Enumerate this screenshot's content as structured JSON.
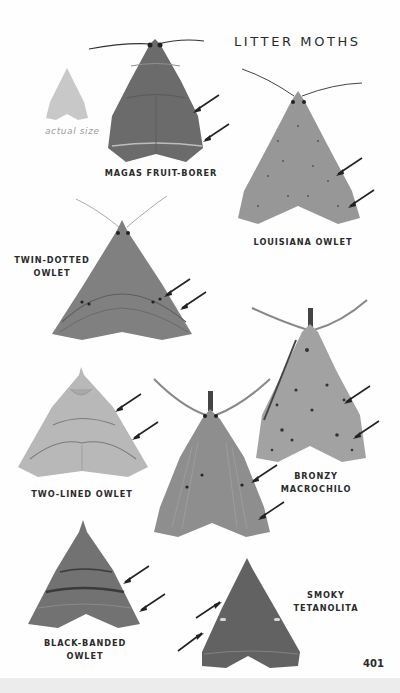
{
  "page": {
    "title": "LITTER MOTHS",
    "page_number": "401",
    "scale_reference": {
      "caption": "actual size",
      "icon": "moth-silhouette-icon"
    }
  },
  "species": [
    {
      "id": "magas",
      "label_lines": [
        "MAGAS FRUIT-BORER"
      ],
      "tone": "#6a6a6a",
      "arrows": 2
    },
    {
      "id": "louisiana",
      "label_lines": [
        "LOUISIANA OWLET"
      ],
      "tone": "#8f8f8f",
      "arrows": 2
    },
    {
      "id": "twin-dotted",
      "label_lines": [
        "TWIN-DOTTED",
        "OWLET"
      ],
      "tone": "#7e7e7e",
      "arrows": 2
    },
    {
      "id": "two-lined",
      "label_lines": [
        "TWO-LINED OWLET"
      ],
      "tone": "#b3b3b3",
      "arrows": 2
    },
    {
      "id": "bronzy",
      "label_lines": [
        "BRONZY",
        "MACROCHILO"
      ],
      "tone": "#a0a0a0",
      "arrows": 2
    },
    {
      "id": "macrochilo-center",
      "label_lines": [],
      "tone": "#8c8c8c",
      "arrows": 2
    },
    {
      "id": "black-banded",
      "label_lines": [
        "BLACK-BANDED",
        "OWLET"
      ],
      "tone": "#707070",
      "arrows": 2
    },
    {
      "id": "smoky",
      "label_lines": [
        "SMOKY",
        "TETANOLITA"
      ],
      "tone": "#5f5f5f",
      "arrows": 2
    }
  ]
}
